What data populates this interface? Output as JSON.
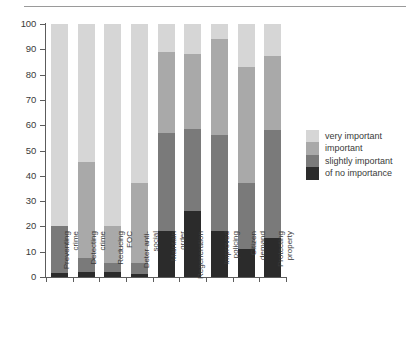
{
  "chart_data": {
    "type": "bar",
    "subtype": "stacked-bar-percent",
    "title": "",
    "xlabel": "",
    "ylabel": "",
    "ylim": [
      0,
      100
    ],
    "ytick_step": 10,
    "yticks": [
      0,
      10,
      20,
      30,
      40,
      50,
      60,
      70,
      80,
      90,
      100
    ],
    "grid": false,
    "legend_position": "right",
    "categories": [
      "Preventing\ncrime",
      "Detecting\ncrime",
      "Reducing\nFOC",
      "Deter anti-\nsocial",
      "Maintain\norder",
      "Regeneration",
      "Improved\npolicing",
      "Citizen\ndemand",
      "Protecting\nproperty"
    ],
    "categories_flat": [
      "Preventing crime",
      "Detecting crime",
      "Reducing FOC",
      "Deter anti-social",
      "Maintain order",
      "Regeneration",
      "Improved policing",
      "Citizen demand",
      "Protecting property"
    ],
    "series": [
      {
        "name": "of no importance",
        "color": "#2b2b2b",
        "values": [
          1.5,
          2.0,
          2.0,
          1.0,
          18.0,
          26.0,
          18.0,
          11.0,
          15.5
        ]
      },
      {
        "name": "slightly important",
        "color": "#7a7a7a",
        "values": [
          18.5,
          5.5,
          3.5,
          4.5,
          39.0,
          32.5,
          38.0,
          26.0,
          42.5
        ]
      },
      {
        "name": "important",
        "color": "#a9a9a9",
        "values": [
          0.0,
          38.0,
          14.5,
          31.5,
          32.0,
          29.5,
          38.0,
          46.0,
          29.5
        ]
      },
      {
        "name": "very important",
        "color": "#d6d6d6",
        "values": [
          80.0,
          54.5,
          80.0,
          63.0,
          11.0,
          12.0,
          6.0,
          17.0,
          12.5
        ]
      }
    ],
    "cumulative_tops": {
      "of no importance": [
        1.5,
        2.0,
        2.0,
        1.0,
        18.0,
        26.0,
        18.0,
        11.0,
        15.5
      ],
      "slightly important": [
        20.0,
        7.5,
        5.5,
        5.5,
        57.0,
        58.5,
        56.0,
        37.0,
        58.0
      ],
      "important": [
        20.0,
        45.5,
        20.0,
        37.0,
        89.0,
        88.0,
        94.0,
        83.0,
        87.5
      ],
      "very important": [
        100,
        100,
        100,
        100,
        100,
        100,
        100,
        100,
        100
      ]
    }
  },
  "legend": {
    "items": [
      {
        "label": "very important",
        "color": "#d6d6d6"
      },
      {
        "label": "important",
        "color": "#a9a9a9"
      },
      {
        "label": "slightly importa",
        "color": "#7a7a7a"
      },
      {
        "label": "of no importance",
        "color": "#2b2b2b"
      }
    ],
    "items_text": [
      "very important",
      "important",
      "slightly important",
      "of no importance"
    ]
  },
  "axis": {
    "y_tick_labels": [
      "100",
      "90",
      "80",
      "70",
      "60",
      "50",
      "40",
      "30",
      "20",
      "10",
      "0"
    ]
  }
}
